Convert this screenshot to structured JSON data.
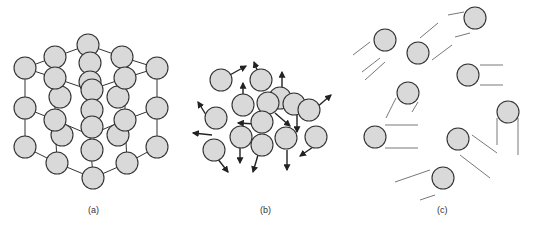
{
  "figure": {
    "panels": [
      {
        "id": "a",
        "label": "(a)",
        "depicts": "crystalline solid lattice"
      },
      {
        "id": "b",
        "label": "(b)",
        "depicts": "liquid with random motion arrows"
      },
      {
        "id": "c",
        "label": "(c)",
        "depicts": "gas particles with motion trails"
      }
    ]
  }
}
